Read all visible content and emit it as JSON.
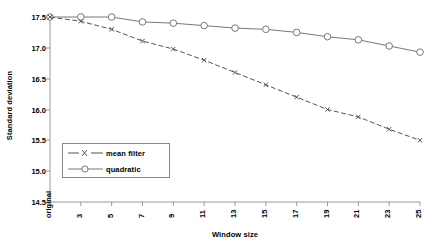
{
  "chart_data": {
    "type": "line",
    "title": "",
    "xlabel": "Window size",
    "ylabel": "Standard deviation",
    "categories": [
      "original",
      "3",
      "5",
      "7",
      "9",
      "11",
      "13",
      "15",
      "17",
      "19",
      "21",
      "23",
      "25"
    ],
    "ylim": [
      14.5,
      17.5
    ],
    "yticks": [
      "14.5",
      "15.0",
      "15.5",
      "16.0",
      "16.5",
      "17.0",
      "17.5"
    ],
    "ytick_values": [
      14.5,
      15.0,
      15.5,
      16.0,
      16.5,
      17.0,
      17.5
    ],
    "grid": false,
    "legend_position": "center-left-lower",
    "series": [
      {
        "name": "mean filter",
        "marker": "x",
        "linestyle": "dashed",
        "color": "#555555",
        "values": [
          17.5,
          17.43,
          17.3,
          17.11,
          16.98,
          16.8,
          16.6,
          16.4,
          16.2,
          16.0,
          15.88,
          15.68,
          15.5
        ]
      },
      {
        "name": "quadratic",
        "marker": "circle",
        "linestyle": "solid",
        "color": "#777777",
        "values": [
          17.5,
          17.5,
          17.5,
          17.42,
          17.4,
          17.36,
          17.32,
          17.3,
          17.25,
          17.18,
          17.13,
          17.03,
          16.93
        ]
      }
    ]
  },
  "legend": {
    "entries": [
      {
        "label": "mean filter"
      },
      {
        "label": "quadratic"
      }
    ]
  },
  "axes": {
    "x_title": "Window size",
    "y_title": "Standard deviation"
  }
}
